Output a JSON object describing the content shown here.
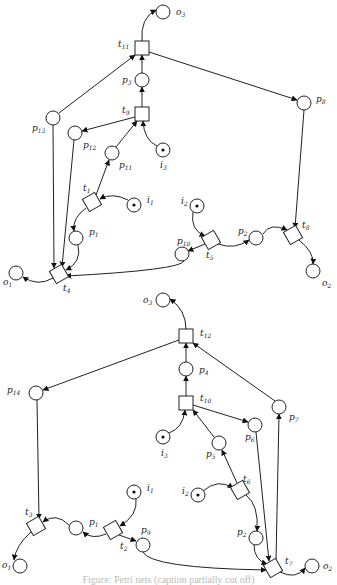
{
  "diagram": {
    "type": "petri-net",
    "caption": "Figure: Petri nets (caption partially cut off)",
    "nets": [
      {
        "id": "top",
        "places": [
          {
            "id": "o3",
            "base": "o",
            "sub": "3",
            "x": 163,
            "y": 12,
            "token": false,
            "lx": 176,
            "ly": 15
          },
          {
            "id": "p3",
            "base": "p",
            "sub": "3",
            "x": 142,
            "y": 80,
            "token": false,
            "lx": 122,
            "ly": 83
          },
          {
            "id": "p8",
            "base": "p",
            "sub": "8",
            "x": 304,
            "y": 103,
            "token": false,
            "lx": 316,
            "ly": 102
          },
          {
            "id": "p13",
            "base": "p",
            "sub": "13",
            "x": 53,
            "y": 118,
            "token": false,
            "lx": 32,
            "ly": 131
          },
          {
            "id": "p12",
            "base": "p",
            "sub": "12",
            "x": 75,
            "y": 133,
            "token": false,
            "lx": 83,
            "ly": 148
          },
          {
            "id": "p11",
            "base": "p",
            "sub": "11",
            "x": 112,
            "y": 153,
            "token": false,
            "lx": 119,
            "ly": 168
          },
          {
            "id": "i3",
            "base": "i",
            "sub": "3",
            "x": 163,
            "y": 150,
            "token": true,
            "lx": 160,
            "ly": 168
          },
          {
            "id": "i1",
            "base": "i",
            "sub": "1",
            "x": 134,
            "y": 205,
            "token": true,
            "lx": 147,
            "ly": 203
          },
          {
            "id": "p1",
            "base": "p",
            "sub": "1",
            "x": 76,
            "y": 238,
            "token": false,
            "lx": 89,
            "ly": 235
          },
          {
            "id": "o1",
            "base": "o",
            "sub": "1",
            "x": 16,
            "y": 273,
            "token": false,
            "lx": 3,
            "ly": 285
          },
          {
            "id": "i2",
            "base": "i",
            "sub": "2",
            "x": 197,
            "y": 206,
            "token": true,
            "lx": 181,
            "ly": 204
          },
          {
            "id": "p10",
            "base": "p",
            "sub": "10",
            "x": 182,
            "y": 254,
            "token": false,
            "lx": 177,
            "ly": 244
          },
          {
            "id": "p2",
            "base": "p",
            "sub": "2",
            "x": 256,
            "y": 238,
            "token": false,
            "lx": 238,
            "ly": 234
          },
          {
            "id": "o2",
            "base": "o",
            "sub": "2",
            "x": 313,
            "y": 271,
            "token": false,
            "lx": 322,
            "ly": 286
          }
        ],
        "transitions": [
          {
            "id": "t11",
            "base": "t",
            "sub": "11",
            "x": 142,
            "y": 48,
            "shape": "square",
            "lx": 118,
            "ly": 47
          },
          {
            "id": "t9",
            "base": "t",
            "sub": "9",
            "x": 142,
            "y": 114,
            "shape": "square",
            "lx": 122,
            "ly": 113
          },
          {
            "id": "t1",
            "base": "t",
            "sub": "1",
            "x": 92,
            "y": 202,
            "shape": "diamond",
            "lx": 83,
            "ly": 191
          },
          {
            "id": "t4",
            "base": "t",
            "sub": "4",
            "x": 59,
            "y": 274,
            "shape": "diamond",
            "lx": 63,
            "ly": 291
          },
          {
            "id": "t5",
            "base": "t",
            "sub": "5",
            "x": 211,
            "y": 240,
            "shape": "diamond",
            "lx": 206,
            "ly": 258
          },
          {
            "id": "t8",
            "base": "t",
            "sub": "8",
            "x": 293,
            "y": 235,
            "shape": "diamond",
            "lx": 302,
            "ly": 228
          }
        ],
        "arcs": [
          {
            "from": "t11",
            "to": "o3",
            "d": "M142,41 Q140,18 156,10"
          },
          {
            "from": "p3",
            "to": "t11",
            "d": "M142,73 L142,55"
          },
          {
            "from": "t11",
            "to": "p8",
            "d": "M149,52 L297,100"
          },
          {
            "from": "p13",
            "to": "t11",
            "d": "M59,113 L135,55"
          },
          {
            "from": "t9",
            "to": "p3",
            "d": "M142,107 L142,87"
          },
          {
            "from": "t9",
            "to": "p12",
            "d": "M135,117 L82,131"
          },
          {
            "from": "p11",
            "to": "t9",
            "d": "M116,147 L137,121"
          },
          {
            "from": "i3",
            "to": "t9",
            "d": "M157,146 Q144,140 143,121"
          },
          {
            "from": "t1",
            "to": "p11",
            "d": "M96,195 L109,160"
          },
          {
            "from": "i1",
            "to": "t1",
            "d": "M128,200 Q112,192 100,199"
          },
          {
            "from": "t1",
            "to": "p1",
            "d": "M86,208 Q72,218 74,231"
          },
          {
            "from": "p1",
            "to": "t4",
            "d": "M78,245 Q82,262 66,270"
          },
          {
            "from": "p13",
            "to": "t4",
            "d": "M53,125 L54,268"
          },
          {
            "from": "p12",
            "to": "t4",
            "d": "M74,140 L62,267"
          },
          {
            "from": "t4",
            "to": "o1",
            "d": "M53,278 Q38,287 23,277"
          },
          {
            "from": "p10",
            "to": "t4",
            "d": "M184,261 Q180,270 66,276"
          },
          {
            "from": "i2",
            "to": "t5",
            "d": "M193,212 Q190,230 205,236"
          },
          {
            "from": "t5",
            "to": "p10",
            "d": "M205,244 L188,251"
          },
          {
            "from": "t5",
            "to": "p2",
            "d": "M218,244 Q235,250 249,240"
          },
          {
            "from": "p2",
            "to": "t8",
            "d": "M263,234 Q270,222 287,230"
          },
          {
            "from": "p8",
            "to": "t8",
            "d": "M304,110 L295,228"
          },
          {
            "from": "t8",
            "to": "o2",
            "d": "M299,240 Q314,252 313,264"
          }
        ]
      },
      {
        "id": "bottom",
        "places": [
          {
            "id": "o3b",
            "base": "o",
            "sub": "3",
            "x": 163,
            "y": 300,
            "token": false,
            "lx": 143,
            "ly": 303
          },
          {
            "id": "p4",
            "base": "p",
            "sub": "4",
            "x": 186,
            "y": 369,
            "token": false,
            "lx": 199,
            "ly": 373
          },
          {
            "id": "p14",
            "base": "p",
            "sub": "14",
            "x": 36,
            "y": 393,
            "token": false,
            "lx": 7,
            "ly": 393
          },
          {
            "id": "p7",
            "base": "p",
            "sub": "7",
            "x": 279,
            "y": 407,
            "token": false,
            "lx": 289,
            "ly": 420
          },
          {
            "id": "p6",
            "base": "p",
            "sub": "6",
            "x": 255,
            "y": 425,
            "token": false,
            "lx": 245,
            "ly": 440
          },
          {
            "id": "i3b",
            "base": "i",
            "sub": "3",
            "x": 163,
            "y": 437,
            "token": true,
            "lx": 161,
            "ly": 456
          },
          {
            "id": "p5",
            "base": "p",
            "sub": "5",
            "x": 219,
            "y": 443,
            "token": false,
            "lx": 206,
            "ly": 457
          },
          {
            "id": "i2b",
            "base": "i",
            "sub": "2",
            "x": 198,
            "y": 495,
            "token": true,
            "lx": 182,
            "ly": 494
          },
          {
            "id": "i1b",
            "base": "i",
            "sub": "1",
            "x": 134,
            "y": 492,
            "token": true,
            "lx": 147,
            "ly": 491
          },
          {
            "id": "p1b",
            "base": "p",
            "sub": "1",
            "x": 76,
            "y": 528,
            "token": false,
            "lx": 89,
            "ly": 525
          },
          {
            "id": "p9",
            "base": "p",
            "sub": "9",
            "x": 143,
            "y": 545,
            "token": false,
            "lx": 141,
            "ly": 533
          },
          {
            "id": "p2b",
            "base": "p",
            "sub": "2",
            "x": 256,
            "y": 538,
            "token": false,
            "lx": 237,
            "ly": 535
          },
          {
            "id": "o1b",
            "base": "o",
            "sub": "1",
            "x": 20,
            "y": 566,
            "token": false,
            "lx": 2,
            "ly": 568
          },
          {
            "id": "o2b",
            "base": "o",
            "sub": "2",
            "x": 312,
            "y": 566,
            "token": false,
            "lx": 323,
            "ly": 569
          }
        ],
        "transitions": [
          {
            "id": "t12",
            "base": "t",
            "sub": "12",
            "x": 186,
            "y": 336,
            "shape": "square",
            "lx": 200,
            "ly": 336
          },
          {
            "id": "t10",
            "base": "t",
            "sub": "10",
            "x": 186,
            "y": 403,
            "shape": "square",
            "lx": 200,
            "ly": 401
          },
          {
            "id": "t6",
            "base": "t",
            "sub": "6",
            "x": 240,
            "y": 490,
            "shape": "diamond",
            "lx": 243,
            "ly": 482
          },
          {
            "id": "t3",
            "base": "t",
            "sub": "3",
            "x": 36,
            "y": 526,
            "shape": "diamond",
            "lx": 25,
            "ly": 515
          },
          {
            "id": "t2",
            "base": "t",
            "sub": "2",
            "x": 113,
            "y": 530,
            "shape": "diamond",
            "lx": 120,
            "ly": 549
          },
          {
            "id": "t7",
            "base": "t",
            "sub": "7",
            "x": 273,
            "y": 568,
            "shape": "diamond",
            "lx": 285,
            "ly": 564
          }
        ],
        "arcs": [
          {
            "from": "t12",
            "to": "o3b",
            "d": "M186,329 Q186,310 170,299"
          },
          {
            "from": "p4",
            "to": "t12",
            "d": "M186,362 L186,343"
          },
          {
            "from": "t12",
            "to": "p14",
            "d": "M179,340 L43,390"
          },
          {
            "from": "p7",
            "to": "t12",
            "d": "M275,401 L193,343"
          },
          {
            "from": "t10",
            "to": "p4",
            "d": "M186,396 L186,376"
          },
          {
            "from": "t10",
            "to": "p6",
            "d": "M193,405 L248,422"
          },
          {
            "from": "i3b",
            "to": "t10",
            "d": "M169,433 Q183,428 185,410"
          },
          {
            "from": "p5",
            "to": "t10",
            "d": "M214,437 L193,410"
          },
          {
            "from": "t6",
            "to": "p5",
            "d": "M237,483 L222,450"
          },
          {
            "from": "i2b",
            "to": "t6",
            "d": "M203,491 Q218,478 233,488"
          },
          {
            "from": "t6",
            "to": "p2b",
            "d": "M246,495 Q259,505 257,531"
          },
          {
            "from": "p14",
            "to": "t3",
            "d": "M37,400 L39,519"
          },
          {
            "from": "p1b",
            "to": "t3",
            "d": "M69,525 Q56,512 43,522"
          },
          {
            "from": "t3",
            "to": "o1b",
            "d": "M31,532 Q16,545 14,560"
          },
          {
            "from": "i1b",
            "to": "t2",
            "d": "M136,499 Q138,515 120,526"
          },
          {
            "from": "t2",
            "to": "p1b",
            "d": "M106,534 Q92,540 83,532"
          },
          {
            "from": "t2",
            "to": "p9",
            "d": "M119,535 L136,541"
          },
          {
            "from": "p9",
            "to": "t7",
            "d": "M143,552 Q150,568 266,570"
          },
          {
            "from": "p2b",
            "to": "t7",
            "d": "M254,545 Q254,560 267,564"
          },
          {
            "from": "p6",
            "to": "t7",
            "d": "M256,432 L269,561"
          },
          {
            "from": "t7",
            "to": "p7",
            "d": "M276,561 L279,414"
          },
          {
            "from": "t7",
            "to": "o2b",
            "d": "M280,572 Q296,580 305,568"
          }
        ]
      }
    ]
  }
}
